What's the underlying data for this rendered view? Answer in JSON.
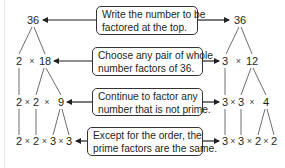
{
  "diagram": {
    "callouts": [
      {
        "line1": "Write the number to be",
        "line2": "factored at the top."
      },
      {
        "line1": "Choose any pair of whole",
        "line2": "number factors of 36."
      },
      {
        "line1": "Continue to factor any",
        "line2": "number that is not prime."
      },
      {
        "line1": "Except for the order, the",
        "line2": "prime factors are the same."
      }
    ],
    "left_tree": {
      "root": "36",
      "row2": [
        "2",
        "18"
      ],
      "row3": [
        "2",
        "2",
        "9"
      ],
      "row4": [
        "2",
        "2",
        "3",
        "3"
      ]
    },
    "right_tree": {
      "root": "36",
      "row2": [
        "3",
        "12"
      ],
      "row3": [
        "3",
        "3",
        "4"
      ],
      "row4": [
        "3",
        "3",
        "2",
        "2"
      ]
    },
    "times_symbol": "×",
    "colors": {
      "line": "#231f20",
      "branch": "#6d6e71",
      "box_border": "#333333"
    }
  }
}
